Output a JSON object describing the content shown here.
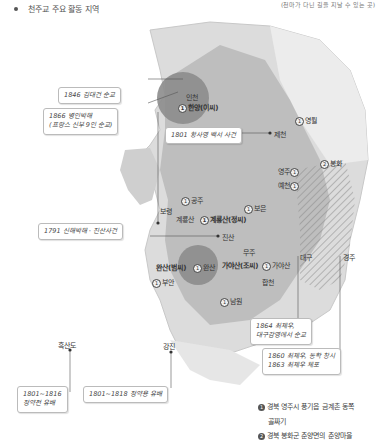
{
  "legend": {
    "label": "천주교 주요 활동 지역",
    "note": "(천마가 다닌 길을 지날 수 있는 곳)"
  },
  "colors": {
    "region_fill": "#b8b8b8",
    "dark_circle": "#8c8c8c",
    "land": "#d9d9d9",
    "line": "#555555"
  },
  "places": {
    "hanyang": "한양(이씨)",
    "incheon": "인천",
    "jecheon": "제천",
    "yeongwol": "영월",
    "bonghwa": "봉화",
    "yeongju": "영주",
    "yecheon": "예천",
    "gongju": "공주",
    "boryeong": "보령",
    "gyeryongsan": "계룡산",
    "gyeryongsan_jeong": "계룡산(정씨)",
    "boeun": "보은",
    "jinsan": "진산",
    "muju": "무주",
    "wansan_beom": "완산(범씨)",
    "wansan": "완산",
    "gayasan_jo": "가야산(조씨)",
    "gayasan": "가야산",
    "hapcheon": "합천",
    "buan": "부안",
    "namwon": "남원",
    "daegu": "대구",
    "gyeongju": "경주",
    "heuksando": "흑산도",
    "gangjin": "강진"
  },
  "events": {
    "e1846": "1846 김대건 순교",
    "e1866_l1": "1866 병인박해",
    "e1866_l2": "(프랑스 신부 9인 순교)",
    "e1801": "1801 황사영 백서 사건",
    "e1791": "1791 신해박해 · 진산사건",
    "e1864_l1": "1864 최제우,",
    "e1864_l2": "대구감영에서 순교",
    "e1860_l1": "1860 최제우, 동학 창시",
    "e1860_l2": "1863 최제우 체포",
    "e1801_16_l1": "1801~1816",
    "e1801_16_l2": "정약전 유배",
    "e1801_18": "1801~1818 정약용 유배"
  },
  "footnotes": [
    {
      "num": "1",
      "line1": "경북 영주시 풍기읍 금계촌 동쪽",
      "line2": "골짜기"
    },
    {
      "num": "2",
      "line1": "경북 봉화군 춘양면의 춘양마을"
    }
  ]
}
